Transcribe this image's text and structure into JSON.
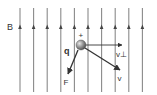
{
  "diagram": {
    "type": "physics-vector-diagram",
    "field": {
      "label": "B",
      "direction": "up",
      "line_count": 10,
      "line_x": [
        20,
        33.6,
        47.2,
        60.8,
        74.4,
        88,
        101.6,
        115.2,
        128.8,
        142.4
      ],
      "line_top": 8,
      "line_bottom": 92,
      "arrowhead_y": 27,
      "color": "#8a8a8a"
    },
    "particle": {
      "label": "q",
      "charge_sign": "+",
      "cx": 81,
      "cy": 45,
      "r": 5
    },
    "vectors": [
      {
        "id": "v_perp",
        "label": "v⊥",
        "x1": 86,
        "y1": 45,
        "x2": 122,
        "y2": 45
      },
      {
        "id": "v",
        "label": "v",
        "x1": 85,
        "y1": 48,
        "x2": 120,
        "y2": 70
      },
      {
        "id": "F",
        "label": "F",
        "x1": 78,
        "y1": 50,
        "x2": 68,
        "y2": 74
      }
    ],
    "labels": {
      "B": "B",
      "plus": "+",
      "q": "q",
      "v_perp": "v⊥",
      "v": "v",
      "F": "F"
    },
    "colors": {
      "vector": "#333333",
      "text": "#333333",
      "sphere_light": "#d0d0d0",
      "sphere_dark": "#555555"
    }
  }
}
